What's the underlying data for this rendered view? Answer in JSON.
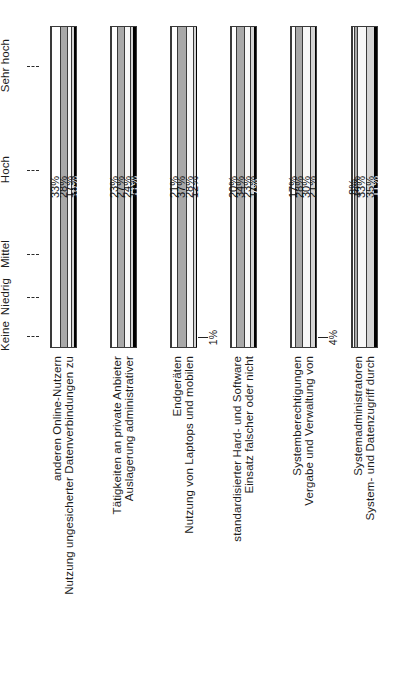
{
  "chart_data": {
    "type": "bar",
    "subtype": "100% stacked horizontal bar (rotated 90°)",
    "title": "",
    "xlabel": "",
    "ylabel": "",
    "grid": false,
    "legend_position": "left-axis",
    "scale_labels": [
      "Keine",
      "Niedrig",
      "Mittel",
      "Hoch",
      "Sehr hoch"
    ],
    "categories": [
      "Nutzung ungesicherter Datenverbindungen zu anderen Online-Nutzern",
      "Auslagerung administrativer Tätigkeiten an private Anbieter",
      "Nutzung von Laptops und mobilen Endgeräten",
      "Einsatz falscher oder nicht standardisierter Hard- und Software",
      "Vergabe und Verwaltung von Systemberechtigungen",
      "System- und Datenzugriff durch Systemadministratoren"
    ],
    "category_lines": [
      [
        "Nutzung ungesicherter Datenverbindungen zu",
        "anderen Online-Nutzern"
      ],
      [
        "Auslagerung administrativer",
        "Tätigkeiten an private Anbieter"
      ],
      [
        "Nutzung von Laptops und mobilen",
        "Endgeräten"
      ],
      [
        "Einsatz falscher oder nicht",
        "standardisierter Hard- und Software"
      ],
      [
        "Vergabe und Verwaltung von",
        "Systemberechtigungen"
      ],
      [
        "System- und Datenzugriff durch",
        "Systemadministratoren"
      ]
    ],
    "series": [
      {
        "name": "Keine",
        "color": "#000000",
        "values": [
          10,
          11,
          1,
          7,
          4,
          11
        ]
      },
      {
        "name": "Niedrig",
        "color": "#d4d4d4",
        "values": [
          11,
          15,
          12,
          17,
          21,
          35
        ]
      },
      {
        "name": "Mittel",
        "color": "#f7f7f7",
        "values": [
          17,
          24,
          28,
          23,
          30,
          33
        ]
      },
      {
        "name": "Hoch",
        "color": "#a8a8a8",
        "values": [
          28,
          27,
          37,
          34,
          28,
          14
        ]
      },
      {
        "name": "Sehr hoch",
        "color": "#ffffff",
        "values": [
          33,
          23,
          21,
          20,
          17,
          8
        ]
      }
    ],
    "value_labels": [
      [
        "10%",
        "11%",
        "17%",
        "28%",
        "33%"
      ],
      [
        "11%",
        "15%",
        "24%",
        "27%",
        "23%"
      ],
      [
        "1%",
        "12%",
        "28%",
        "37%",
        "21%"
      ],
      [
        "7%",
        "17%",
        "23%",
        "34%",
        "20%"
      ],
      [
        "4%",
        "21%",
        "30%",
        "28%",
        "17%"
      ],
      [
        "11%",
        "35%",
        "33%",
        "14%",
        "8%"
      ]
    ],
    "outside_callouts": [
      {
        "bar_index": 2,
        "series": "Keine",
        "label": "1%"
      },
      {
        "bar_index": 4,
        "series": "Keine",
        "label": "4%"
      }
    ],
    "axis_range": [
      0,
      100
    ],
    "axis_unit": "%"
  }
}
